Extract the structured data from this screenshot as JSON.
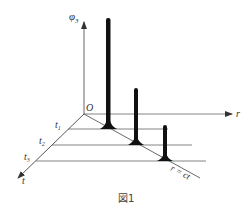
{
  "diagram": {
    "axes": {
      "vertical_label": "φ",
      "vertical_sub": "3",
      "horizontal_label": "r",
      "depth_label": "t",
      "origin_label": "O"
    },
    "time_ticks": [
      {
        "label": "t",
        "sub": "1"
      },
      {
        "label": "t",
        "sub": "2"
      },
      {
        "label": "t",
        "sub": "3"
      }
    ],
    "front_line_label": "r = ct",
    "caption": "図1",
    "colors": {
      "axis": "#555555",
      "spike": "#111111",
      "text": "#333333"
    }
  }
}
